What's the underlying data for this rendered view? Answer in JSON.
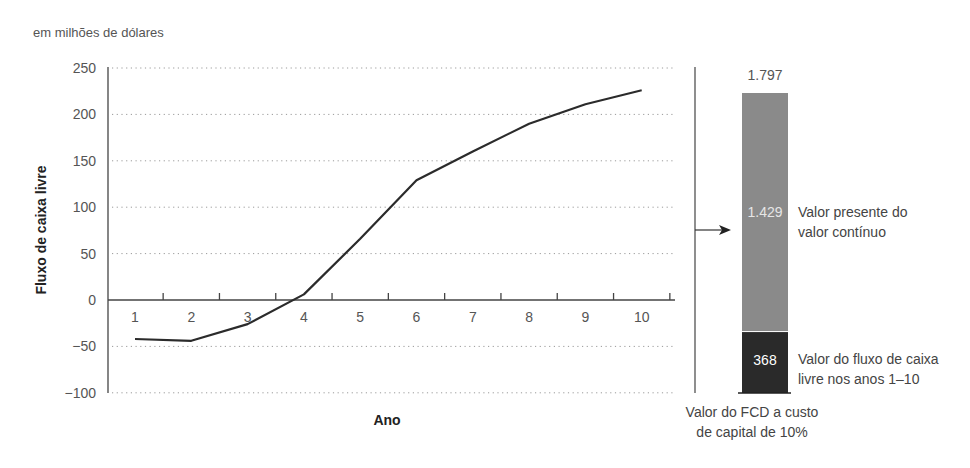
{
  "chart_data": {
    "type": "line",
    "unit_note": "em milhões de dólares",
    "xlabel": "Ano",
    "ylabel": "Fluxo de caixa livre",
    "ylim": [
      -100,
      250
    ],
    "yticks": [
      250,
      200,
      150,
      100,
      50,
      0,
      -50,
      -100
    ],
    "ytick_labels": [
      "250",
      "200",
      "150",
      "100",
      "50",
      "0",
      "−50",
      "−100"
    ],
    "grid": "dotted horizontal",
    "x": [
      1,
      2,
      3,
      4,
      5,
      6,
      7,
      8,
      9,
      10
    ],
    "series": [
      {
        "name": "Fluxo de caixa livre",
        "values": [
          -42,
          -44,
          -26,
          6,
          66,
          129,
          160,
          190,
          211,
          226
        ]
      }
    ],
    "stacked_bar": {
      "title": "Valor do FCD a custo de capital de 10%",
      "title_lines": [
        "Valor do FCD a custo",
        "de capital de 10%"
      ],
      "total": 1797,
      "total_label": "1.797",
      "segments": [
        {
          "name": "Valor do fluxo de caixa livre nos anos 1–10",
          "label_lines": [
            "Valor do fluxo de caixa",
            "livre nos anos 1–10"
          ],
          "value": 368,
          "value_label": "368",
          "color": "#2a2a2a"
        },
        {
          "name": "Valor presente do valor contínuo",
          "label_lines": [
            "Valor presente do",
            "valor contínuo"
          ],
          "value": 1429,
          "value_label": "1.429",
          "color": "#8a8a8a"
        }
      ]
    }
  },
  "colors": {
    "line": "#2b2b2b",
    "grid": "#9a9a9a",
    "axis": "#444444"
  }
}
